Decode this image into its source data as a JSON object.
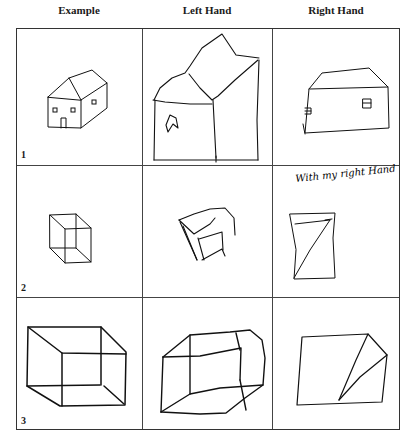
{
  "figure": {
    "columns": [
      {
        "label": "Example"
      },
      {
        "label": "Left Hand"
      },
      {
        "label": "Right Hand"
      }
    ],
    "rows": [
      {
        "number": "1",
        "subject": "house"
      },
      {
        "number": "2",
        "subject": "small cube"
      },
      {
        "number": "3",
        "subject": "large cube"
      }
    ],
    "annotations": {
      "row2_right_caption": "With my right Hand"
    }
  }
}
